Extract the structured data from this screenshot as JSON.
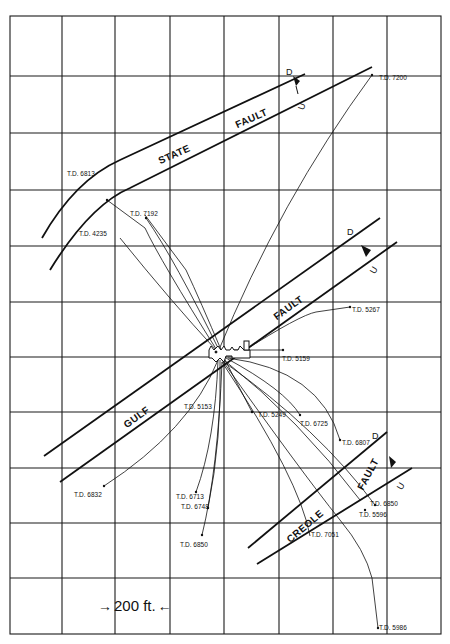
{
  "diagram": {
    "type": "directional well plat / structure map",
    "grid": {
      "x_lines": [
        10,
        62,
        115,
        170,
        224,
        279,
        333,
        387,
        441
      ],
      "y_lines": [
        16,
        76,
        133,
        190,
        246,
        302,
        357,
        412,
        468,
        523,
        578,
        634
      ]
    },
    "scale_bar": {
      "label": "200 ft.",
      "left_arrow": "→",
      "right_arrow": "←"
    },
    "faults": [
      {
        "id": "state",
        "label_1": "STATE",
        "label_2": "FAULT",
        "down": "D",
        "up": "U"
      },
      {
        "id": "gulf",
        "label_1": "GULF",
        "label_2": "FAULT",
        "down": "D",
        "up": "U"
      },
      {
        "id": "creole",
        "label_1": "CREOLE",
        "label_2": "FAULT",
        "down": "D",
        "up": "U"
      }
    ],
    "wells": [
      {
        "label": "T.D. 7200"
      },
      {
        "label": "T.D. 6813"
      },
      {
        "label": "T.D. 7192"
      },
      {
        "label": "T.D. 4235"
      },
      {
        "label": "T.D. 5267"
      },
      {
        "label": "T.D. 5159"
      },
      {
        "label": "T.D. 5153"
      },
      {
        "label": "T.D. 5249"
      },
      {
        "label": "T.D. 6725"
      },
      {
        "label": "T.D. 6807"
      },
      {
        "label": "T.D. 6832"
      },
      {
        "label": "T.D. 6713"
      },
      {
        "label": "T.D. 6748"
      },
      {
        "label": "T.D. 6850"
      },
      {
        "label": "T.D. 7051"
      },
      {
        "label": "T.D. 5596"
      },
      {
        "label": "T.D. 6850"
      },
      {
        "label": "T.D. 5986"
      }
    ]
  }
}
